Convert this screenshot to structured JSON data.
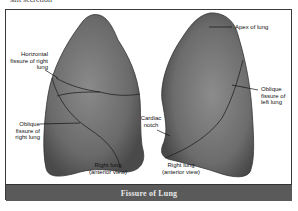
{
  "top_text": "salt secretion",
  "figure": {
    "caption": "Fissure of Lung",
    "labels": {
      "horizontal_fissure": "Horizontal fissure of right lung",
      "oblique_fissure_right": "Oblique fissure of right lung",
      "cardiac_notch": "Cardiac notch",
      "apex": "Apex of lung",
      "oblique_fissure_left": "Oblique fissure of left lung",
      "right_lung_caption_1": "Right lung (anterior view)",
      "right_lung_caption_2": "Right lung (anterior view)"
    },
    "colors": {
      "lung_fill": "#6e6e6e",
      "footer_bg": "#5a5a5a",
      "footer_text": "#e8e8e8",
      "frame_border": "#3a3a3a"
    }
  }
}
